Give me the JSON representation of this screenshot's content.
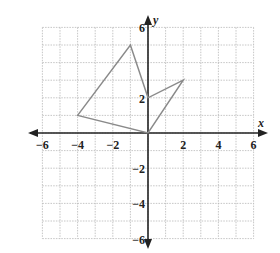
{
  "diagram": {
    "type": "coordinate-plane",
    "axes": {
      "x_label": "x",
      "y_label": "y",
      "x_range": [
        -6,
        6
      ],
      "y_range": [
        -6,
        6
      ],
      "grid_step": 1,
      "grid": true
    },
    "x_ticks": [
      {
        "value": -6,
        "label": "−6"
      },
      {
        "value": -4,
        "label": "−4"
      },
      {
        "value": -2,
        "label": "−2"
      },
      {
        "value": 2,
        "label": "2"
      },
      {
        "value": 4,
        "label": "4"
      },
      {
        "value": 6,
        "label": "6"
      }
    ],
    "y_ticks": [
      {
        "value": 6,
        "label": "6"
      },
      {
        "value": 2,
        "label": "2"
      },
      {
        "value": -2,
        "label": "−2"
      },
      {
        "value": -4,
        "label": "−4"
      },
      {
        "value": -6,
        "label": "−6"
      }
    ],
    "polygon": {
      "vertices": [
        [
          -4,
          1
        ],
        [
          -1,
          5
        ],
        [
          0,
          2
        ],
        [
          2,
          3
        ],
        [
          0,
          0
        ]
      ],
      "stroke_color": "#8a8a8a"
    }
  }
}
